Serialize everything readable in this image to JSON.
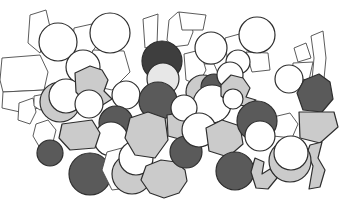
{
  "figure": {
    "name": "amorphous-atomic-packing-diagram",
    "canvas": {
      "width": 353,
      "height": 207,
      "background": "#ffffff"
    },
    "palette": {
      "white": "#ffffff",
      "light": "#cbcbcb",
      "lighter": "#e7e7e7",
      "dark": "#5a5a5a",
      "darker": "#3e3e3e",
      "outline": "#2e2e2e",
      "cell_outline": "#4a4a4a"
    },
    "shapes": [
      {
        "kind": "cell",
        "name": "grain-cell-1",
        "fill": "white",
        "points": [
          [
            30,
            15
          ],
          [
            46,
            10
          ],
          [
            50,
            27
          ],
          [
            40,
            53
          ],
          [
            28,
            43
          ]
        ]
      },
      {
        "kind": "cell",
        "name": "grain-cell-2",
        "fill": "white",
        "points": [
          [
            2,
            58
          ],
          [
            40,
            55
          ],
          [
            48,
            72
          ],
          [
            44,
            90
          ],
          [
            3,
            92
          ],
          [
            0,
            80
          ]
        ]
      },
      {
        "kind": "cell",
        "name": "grain-cell-3",
        "fill": "white",
        "points": [
          [
            3,
            92
          ],
          [
            44,
            90
          ],
          [
            48,
            106
          ],
          [
            20,
            112
          ],
          [
            2,
            108
          ]
        ]
      },
      {
        "kind": "cell",
        "name": "grain-cell-4",
        "fill": "white",
        "points": [
          [
            74,
            28
          ],
          [
            92,
            24
          ],
          [
            99,
            42
          ],
          [
            88,
            58
          ],
          [
            72,
            52
          ]
        ]
      },
      {
        "kind": "cell",
        "name": "grain-cell-5",
        "fill": "white",
        "points": [
          [
            93,
            50
          ],
          [
            124,
            51
          ],
          [
            130,
            72
          ],
          [
            112,
            90
          ],
          [
            94,
            86
          ],
          [
            89,
            65
          ]
        ]
      },
      {
        "kind": "cell",
        "name": "grain-cell-6",
        "fill": "white",
        "points": [
          [
            143,
            19
          ],
          [
            158,
            14
          ],
          [
            157,
            45
          ],
          [
            145,
            48
          ]
        ]
      },
      {
        "kind": "cell",
        "name": "grain-cell-7",
        "fill": "white",
        "points": [
          [
            167,
            40
          ],
          [
            169,
            20
          ],
          [
            178,
            12
          ],
          [
            190,
            16
          ],
          [
            193,
            32
          ],
          [
            188,
            45
          ],
          [
            172,
            47
          ]
        ]
      },
      {
        "kind": "cell",
        "name": "grain-cell-8",
        "fill": "white",
        "points": [
          [
            179,
            12
          ],
          [
            206,
            15
          ],
          [
            203,
            30
          ],
          [
            182,
            30
          ]
        ]
      },
      {
        "kind": "cell",
        "name": "grain-cell-9",
        "fill": "white",
        "points": [
          [
            225,
            38
          ],
          [
            243,
            33
          ],
          [
            250,
            50
          ],
          [
            241,
            62
          ],
          [
            227,
            57
          ]
        ]
      },
      {
        "kind": "cell",
        "name": "grain-cell-10",
        "fill": "white",
        "points": [
          [
            196,
            64
          ],
          [
            214,
            64
          ],
          [
            220,
            78
          ],
          [
            208,
            88
          ],
          [
            196,
            80
          ]
        ]
      },
      {
        "kind": "cell",
        "name": "grain-cell-11",
        "fill": "white",
        "points": [
          [
            246,
            52
          ],
          [
            268,
            53
          ],
          [
            270,
            70
          ],
          [
            252,
            72
          ]
        ]
      },
      {
        "kind": "cell",
        "name": "grain-cell-12",
        "fill": "white",
        "points": [
          [
            294,
            48
          ],
          [
            306,
            43
          ],
          [
            311,
            58
          ],
          [
            298,
            62
          ]
        ]
      },
      {
        "kind": "cell",
        "name": "grain-cell-13",
        "fill": "white",
        "points": [
          [
            293,
            63
          ],
          [
            313,
            62
          ],
          [
            309,
            80
          ],
          [
            292,
            78
          ]
        ]
      },
      {
        "kind": "cell",
        "name": "grain-cell-14",
        "fill": "white",
        "points": [
          [
            311,
            36
          ],
          [
            323,
            31
          ],
          [
            326,
            58
          ],
          [
            324,
            79
          ],
          [
            312,
            80
          ],
          [
            314,
            58
          ]
        ]
      },
      {
        "kind": "cell",
        "name": "grain-cell-15",
        "fill": "white",
        "points": [
          [
            19,
            103
          ],
          [
            33,
            98
          ],
          [
            36,
            112
          ],
          [
            30,
            124
          ],
          [
            18,
            120
          ]
        ]
      },
      {
        "kind": "cell",
        "name": "grain-cell-16",
        "fill": "white",
        "points": [
          [
            34,
            96
          ],
          [
            50,
            93
          ],
          [
            53,
            104
          ],
          [
            40,
            110
          ],
          [
            34,
            106
          ]
        ]
      },
      {
        "kind": "cell",
        "name": "grain-cell-17",
        "fill": "white",
        "points": [
          [
            36,
            124
          ],
          [
            48,
            120
          ],
          [
            56,
            130
          ],
          [
            52,
            146
          ],
          [
            40,
            148
          ],
          [
            33,
            136
          ]
        ]
      },
      {
        "kind": "cell",
        "name": "grain-cell-18",
        "fill": "white",
        "points": [
          [
            269,
            118
          ],
          [
            290,
            113
          ],
          [
            298,
            124
          ],
          [
            292,
            138
          ],
          [
            273,
            136
          ],
          [
            265,
            128
          ]
        ]
      },
      {
        "kind": "cell",
        "name": "grain-cell-19",
        "fill": "white",
        "points": [
          [
            184,
            54
          ],
          [
            200,
            50
          ],
          [
            206,
            70
          ],
          [
            198,
            85
          ],
          [
            186,
            80
          ]
        ]
      },
      {
        "kind": "atom",
        "name": "atom-white-1",
        "fill": "white",
        "cx": 58,
        "cy": 42,
        "r": 19
      },
      {
        "kind": "atom",
        "name": "atom-white-2",
        "fill": "white",
        "cx": 110,
        "cy": 33,
        "r": 20
      },
      {
        "kind": "atom",
        "name": "atom-white-3",
        "fill": "white",
        "cx": 83,
        "cy": 67,
        "r": 17
      },
      {
        "kind": "atom",
        "name": "atom-light-1",
        "fill": "light",
        "cx": 60,
        "cy": 102,
        "r": 20
      },
      {
        "kind": "atom",
        "name": "atom-white-4",
        "fill": "white",
        "cx": 66,
        "cy": 96,
        "r": 17
      },
      {
        "kind": "blob",
        "name": "blob-light-1",
        "fill": "light",
        "points": [
          [
            75,
            73
          ],
          [
            90,
            66
          ],
          [
            102,
            70
          ],
          [
            108,
            80
          ],
          [
            104,
            91
          ],
          [
            112,
            99
          ],
          [
            101,
            106
          ],
          [
            86,
            103
          ],
          [
            76,
            92
          ]
        ]
      },
      {
        "kind": "atom",
        "name": "atom-white-5",
        "fill": "white",
        "cx": 89,
        "cy": 104,
        "r": 14
      },
      {
        "kind": "atom",
        "name": "atom-white-6",
        "fill": "white",
        "cx": 126,
        "cy": 95,
        "r": 14
      },
      {
        "kind": "atom",
        "name": "atom-dark-1",
        "fill": "dark",
        "cx": 116,
        "cy": 123,
        "r": 17
      },
      {
        "kind": "atom",
        "name": "atom-white-7",
        "fill": "white",
        "cx": 111,
        "cy": 139,
        "r": 17
      },
      {
        "kind": "blob",
        "name": "blob-light-2",
        "fill": "light",
        "points": [
          [
            62,
            124
          ],
          [
            92,
            120
          ],
          [
            100,
            133
          ],
          [
            95,
            148
          ],
          [
            70,
            150
          ],
          [
            59,
            138
          ]
        ]
      },
      {
        "kind": "atom",
        "name": "atom-dark-2",
        "fill": "dark",
        "cx": 50,
        "cy": 153,
        "r": 13
      },
      {
        "kind": "atom",
        "name": "atom-dark-3",
        "fill": "dark",
        "cx": 90,
        "cy": 174,
        "r": 21
      },
      {
        "kind": "cell",
        "name": "grain-cell-20",
        "fill": "white",
        "points": [
          [
            107,
            152
          ],
          [
            122,
            148
          ],
          [
            120,
            170
          ],
          [
            127,
            188
          ],
          [
            112,
            190
          ],
          [
            102,
            170
          ]
        ]
      },
      {
        "kind": "atom",
        "name": "atom-light-2",
        "fill": "light",
        "cx": 132,
        "cy": 174,
        "r": 20
      },
      {
        "kind": "atom",
        "name": "atom-white-8",
        "fill": "white",
        "cx": 136,
        "cy": 158,
        "r": 17
      },
      {
        "kind": "blob",
        "name": "blob-light-3",
        "fill": "light",
        "points": [
          [
            146,
            166
          ],
          [
            161,
            160
          ],
          [
            176,
            162
          ],
          [
            185,
            170
          ],
          [
            187,
            181
          ],
          [
            179,
            193
          ],
          [
            164,
            198
          ],
          [
            150,
            193
          ],
          [
            141,
            180
          ]
        ]
      },
      {
        "kind": "atom",
        "name": "atom-darker-1",
        "fill": "darker",
        "cx": 162,
        "cy": 61,
        "r": 20
      },
      {
        "kind": "atom",
        "name": "atom-lighter-1",
        "fill": "lighter",
        "cx": 163,
        "cy": 79,
        "r": 16
      },
      {
        "kind": "atom",
        "name": "atom-dark-4",
        "fill": "dark",
        "cx": 158,
        "cy": 101,
        "r": 19
      },
      {
        "kind": "atom",
        "name": "atom-light-3",
        "fill": "light",
        "cx": 203,
        "cy": 92,
        "r": 17
      },
      {
        "kind": "atom",
        "name": "atom-dark-5",
        "fill": "dark",
        "cx": 214,
        "cy": 87,
        "r": 13
      },
      {
        "kind": "atom",
        "name": "atom-white-9",
        "fill": "white",
        "cx": 212,
        "cy": 104,
        "r": 19
      },
      {
        "kind": "blob",
        "name": "blob-light-4",
        "fill": "light",
        "points": [
          [
            130,
            118
          ],
          [
            148,
            112
          ],
          [
            165,
            118
          ],
          [
            168,
            140
          ],
          [
            155,
            158
          ],
          [
            135,
            155
          ],
          [
            125,
            138
          ]
        ]
      },
      {
        "kind": "blob",
        "name": "blob-light-5",
        "fill": "light",
        "points": [
          [
            167,
            115
          ],
          [
            186,
            112
          ],
          [
            191,
            126
          ],
          [
            183,
            140
          ],
          [
            168,
            136
          ]
        ]
      },
      {
        "kind": "atom",
        "name": "atom-white-10",
        "fill": "white",
        "cx": 184,
        "cy": 108,
        "r": 13
      },
      {
        "kind": "atom",
        "name": "atom-dark-6",
        "fill": "dark",
        "cx": 186,
        "cy": 152,
        "r": 16
      },
      {
        "kind": "atom",
        "name": "atom-white-11",
        "fill": "white",
        "cx": 199,
        "cy": 130,
        "r": 17
      },
      {
        "kind": "blob",
        "name": "blob-light-6",
        "fill": "light",
        "points": [
          [
            206,
            128
          ],
          [
            222,
            120
          ],
          [
            240,
            126
          ],
          [
            243,
            144
          ],
          [
            228,
            157
          ],
          [
            209,
            151
          ]
        ]
      },
      {
        "kind": "atom",
        "name": "atom-white-12",
        "fill": "white",
        "cx": 238,
        "cy": 62,
        "r": 12
      },
      {
        "kind": "atom",
        "name": "atom-white-13",
        "fill": "white",
        "cx": 230,
        "cy": 75,
        "r": 13
      },
      {
        "kind": "blob",
        "name": "blob-light-7",
        "fill": "light",
        "points": [
          [
            221,
            85
          ],
          [
            231,
            75
          ],
          [
            243,
            78
          ],
          [
            250,
            88
          ],
          [
            246,
            97
          ],
          [
            256,
            100
          ],
          [
            246,
            106
          ],
          [
            231,
            104
          ],
          [
            221,
            96
          ]
        ]
      },
      {
        "kind": "atom",
        "name": "atom-white-14",
        "fill": "white",
        "cx": 233,
        "cy": 99,
        "r": 10
      },
      {
        "kind": "atom",
        "name": "atom-dark-7",
        "fill": "dark",
        "cx": 257,
        "cy": 121,
        "r": 20
      },
      {
        "kind": "atom",
        "name": "atom-white-15",
        "fill": "white",
        "cx": 260,
        "cy": 136,
        "r": 15
      },
      {
        "kind": "atom",
        "name": "atom-dark-8",
        "fill": "dark",
        "cx": 235,
        "cy": 171,
        "r": 19
      },
      {
        "kind": "blob",
        "name": "blob-light-8",
        "fill": "light",
        "points": [
          [
            255,
            158
          ],
          [
            264,
            162
          ],
          [
            262,
            174
          ],
          [
            270,
            169
          ],
          [
            277,
            178
          ],
          [
            268,
            189
          ],
          [
            256,
            188
          ],
          [
            251,
            172
          ]
        ]
      },
      {
        "kind": "atom",
        "name": "atom-white-16",
        "fill": "white",
        "cx": 257,
        "cy": 35,
        "r": 18
      },
      {
        "kind": "atom",
        "name": "atom-white-17",
        "fill": "white",
        "cx": 211,
        "cy": 48,
        "r": 16
      },
      {
        "kind": "atom",
        "name": "atom-white-18",
        "fill": "white",
        "cx": 289,
        "cy": 79,
        "r": 14
      },
      {
        "kind": "blob",
        "name": "blob-dark-1",
        "fill": "dark",
        "points": [
          [
            304,
            80
          ],
          [
            319,
            74
          ],
          [
            330,
            82
          ],
          [
            333,
            99
          ],
          [
            322,
            112
          ],
          [
            303,
            110
          ],
          [
            297,
            93
          ]
        ]
      },
      {
        "kind": "blob",
        "name": "blob-light-9",
        "fill": "light",
        "points": [
          [
            299,
            112
          ],
          [
            334,
            112
          ],
          [
            338,
            127
          ],
          [
            320,
            143
          ],
          [
            300,
            138
          ]
        ]
      },
      {
        "kind": "blob",
        "name": "blob-light-10",
        "fill": "light",
        "points": [
          [
            310,
            145
          ],
          [
            322,
            142
          ],
          [
            318,
            158
          ],
          [
            325,
            170
          ],
          [
            320,
            187
          ],
          [
            309,
            189
          ],
          [
            313,
            166
          ],
          [
            307,
            153
          ]
        ]
      },
      {
        "kind": "atom",
        "name": "atom-light-4",
        "fill": "light",
        "cx": 290,
        "cy": 161,
        "r": 21
      },
      {
        "kind": "atom",
        "name": "atom-white-19",
        "fill": "white",
        "cx": 291,
        "cy": 153,
        "r": 17
      }
    ]
  }
}
